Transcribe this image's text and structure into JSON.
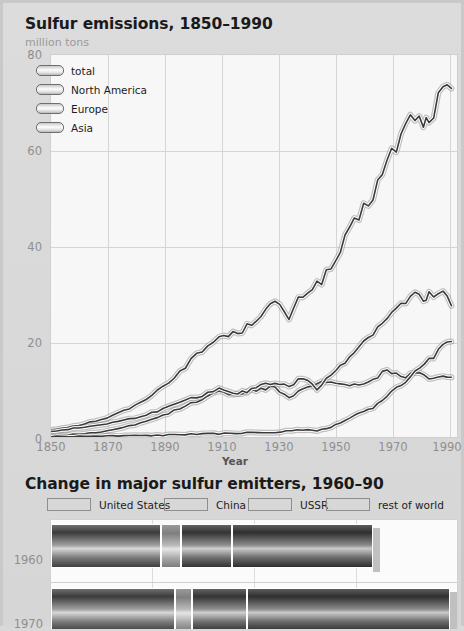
{
  "chart_data": [
    {
      "type": "line",
      "title": "Sulfur emissions, 1850–1990",
      "ylabel": "million tons",
      "xlabel": "Year",
      "xlim": [
        1850,
        1995
      ],
      "ylim": [
        0,
        80
      ],
      "yticks": [
        0,
        20,
        40,
        60,
        80
      ],
      "xticks": [
        1850,
        1870,
        1890,
        1910,
        1930,
        1950,
        1970,
        1990
      ],
      "grid": true,
      "legend_position": "top-left",
      "series": [
        {
          "name": "total",
          "x": [
            1850,
            1860,
            1870,
            1880,
            1890,
            1900,
            1910,
            1915,
            1920,
            1925,
            1930,
            1935,
            1940,
            1945,
            1950,
            1955,
            1960,
            1965,
            1970,
            1975,
            1980,
            1983,
            1985,
            1990,
            1993
          ],
          "values": [
            1.5,
            2.5,
            4.0,
            6.5,
            10.5,
            16.0,
            21.0,
            21.5,
            23.0,
            26.0,
            28.0,
            25.0,
            30.0,
            32.0,
            35.0,
            41.0,
            46.0,
            51.0,
            57.0,
            63.0,
            68.0,
            64.5,
            67.0,
            72.0,
            73.0
          ]
        },
        {
          "name": "North America",
          "x": [
            1850,
            1860,
            1870,
            1880,
            1890,
            1900,
            1910,
            1915,
            1920,
            1925,
            1930,
            1935,
            1940,
            1945,
            1950,
            1955,
            1960,
            1965,
            1970,
            1975,
            1980,
            1985,
            1990,
            1993
          ],
          "values": [
            0.3,
            0.6,
            1.2,
            2.5,
            4.5,
            7.0,
            9.5,
            9.0,
            9.5,
            10.0,
            10.5,
            8.0,
            10.0,
            11.5,
            11.5,
            11.0,
            11.0,
            12.0,
            14.0,
            12.5,
            13.5,
            12.5,
            13.0,
            12.5
          ]
        },
        {
          "name": "Europe",
          "x": [
            1850,
            1860,
            1870,
            1880,
            1890,
            1900,
            1910,
            1915,
            1920,
            1925,
            1930,
            1935,
            1940,
            1945,
            1950,
            1955,
            1960,
            1965,
            1970,
            1975,
            1980,
            1983,
            1985,
            1990,
            1993
          ],
          "values": [
            1.2,
            1.9,
            2.8,
            4.0,
            5.8,
            8.0,
            10.0,
            9.0,
            9.5,
            11.0,
            11.5,
            10.5,
            12.5,
            10.0,
            13.0,
            16.0,
            19.0,
            22.0,
            25.0,
            27.5,
            30.0,
            28.0,
            29.5,
            30.0,
            27.5
          ]
        },
        {
          "name": "Asia",
          "x": [
            1850,
            1870,
            1890,
            1910,
            1930,
            1940,
            1945,
            1950,
            1955,
            1960,
            1965,
            1970,
            1975,
            1980,
            1985,
            1990,
            1993
          ],
          "values": [
            0.1,
            0.2,
            0.4,
            0.7,
            1.0,
            1.5,
            1.2,
            2.0,
            3.5,
            5.0,
            6.0,
            8.5,
            11.0,
            13.5,
            16.0,
            19.0,
            20.0
          ]
        }
      ]
    },
    {
      "type": "bar",
      "orientation": "horizontal",
      "stacked": true,
      "title": "Change in major sulfur emitters, 1960–90",
      "categories": [
        "1960",
        "1970"
      ],
      "series": [
        {
          "name": "United States",
          "values": [
            25.0,
            28.0
          ]
        },
        {
          "name": "China",
          "values": [
            4.5,
            4.0
          ]
        },
        {
          "name": "USSR",
          "values": [
            11.5,
            12.5
          ]
        },
        {
          "name": "rest of world",
          "values": [
            32.0,
            46.0
          ]
        }
      ],
      "grid": true,
      "legend_position": "top"
    }
  ],
  "chart1": {
    "title": "Sulfur emissions, 1850–1990",
    "subtitle": "million tons",
    "axis_title": "Year",
    "yticks": [
      "80",
      "60",
      "40",
      "20",
      "0"
    ],
    "xticks": [
      "1850",
      "1870",
      "1890",
      "1910",
      "1930",
      "1950",
      "1970",
      "1990"
    ],
    "legend": [
      {
        "label": "total"
      },
      {
        "label": "North America"
      },
      {
        "label": "Europe"
      },
      {
        "label": "Asia"
      }
    ]
  },
  "chart2": {
    "title": "Change in major sulfur emitters, 1960–90",
    "legend": [
      {
        "label": "United States"
      },
      {
        "label": "China"
      },
      {
        "label": "USSR"
      },
      {
        "label": "rest of world"
      }
    ],
    "rows": [
      {
        "label": "1960"
      },
      {
        "label": "1970"
      }
    ]
  },
  "colors": {
    "background": "#d9d9d9",
    "plot_background": "#f7f7f7",
    "grid": "#d5d5d5",
    "line": "#3a3a3a",
    "line_highlight": "#ffffff",
    "tick_text": "#8f8f8f",
    "title_text": "#1a1a1a",
    "subtitle_text": "#9a9a9a",
    "bar_dark": "#474747",
    "bar_mid": "#8a8a8a",
    "bar_light": "#b5b5b5"
  }
}
